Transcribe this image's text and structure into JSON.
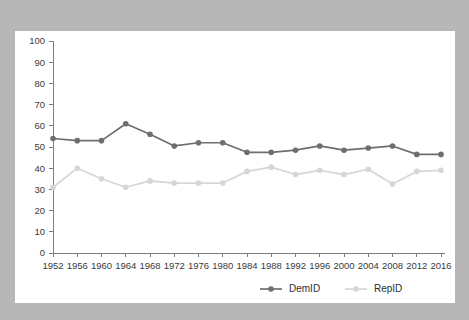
{
  "background": {
    "page_color": "#b7b7b7",
    "panel_color": "#ffffff"
  },
  "chart_data": {
    "type": "line",
    "title": "",
    "subtitle": "",
    "xlabel": "",
    "ylabel": "",
    "categories": [
      "1952",
      "1956",
      "1960",
      "1964",
      "1968",
      "1972",
      "1976",
      "1980",
      "1984",
      "1988",
      "1992",
      "1996",
      "2000",
      "2004",
      "2008",
      "2012",
      "2016"
    ],
    "x": [
      1952,
      1956,
      1960,
      1964,
      1968,
      1972,
      1976,
      1980,
      1984,
      1988,
      1992,
      1996,
      2000,
      2004,
      2008,
      2012,
      2016
    ],
    "series": [
      {
        "name": "DemID",
        "color": "#6e6e6e",
        "marker": "circle",
        "values": [
          54,
          53,
          53,
          61,
          56,
          50.5,
          52,
          52,
          47.5,
          47.5,
          48.5,
          50.5,
          48.5,
          49.5,
          50.5,
          46.5,
          46.5
        ]
      },
      {
        "name": "RepID",
        "color": "#d6d6d6",
        "marker": "circle",
        "values": [
          31,
          40,
          35,
          31,
          34,
          33,
          33,
          33,
          38.5,
          40.5,
          37,
          39,
          37,
          39.5,
          32.5,
          38.5,
          39
        ]
      }
    ],
    "ylim": [
      0,
      100
    ],
    "ytick_step": 10,
    "ytick_labels": [
      "0",
      "10",
      "20",
      "30",
      "40",
      "50",
      "60",
      "70",
      "80",
      "90",
      "100"
    ],
    "grid": false,
    "legend_position": "bottom"
  },
  "legend": {
    "entries": [
      {
        "label": "DemID",
        "color": "#6e6e6e"
      },
      {
        "label": "RepID",
        "color": "#d6d6d6"
      }
    ]
  }
}
